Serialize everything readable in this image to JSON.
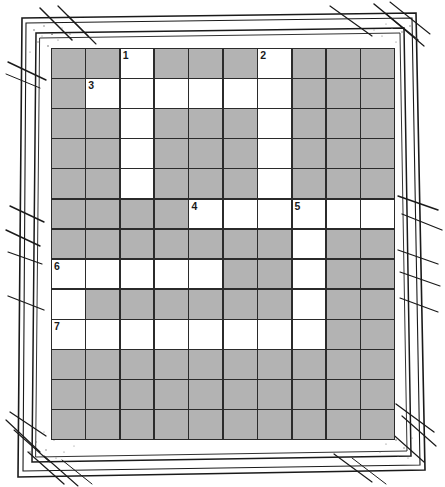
{
  "puzzle": {
    "title": "Crossword Grid",
    "columns": 10,
    "rows": 13,
    "colors": {
      "block": "#b3b3b3",
      "open": "#ffffff",
      "line": "#2b2b2b",
      "number": "#1a1a1a",
      "frame_ink": "#1a1a1a",
      "page": "#ffffff"
    },
    "legend": {
      "open_label": "open cell",
      "block_label": "blocked cell"
    },
    "clue_numbers": [
      {
        "number": "1",
        "row": 0,
        "col": 2
      },
      {
        "number": "2",
        "row": 0,
        "col": 6
      },
      {
        "number": "3",
        "row": 1,
        "col": 1
      },
      {
        "number": "4",
        "row": 5,
        "col": 4
      },
      {
        "number": "5",
        "row": 5,
        "col": 7
      },
      {
        "number": "6",
        "row": 7,
        "col": 0
      },
      {
        "number": "7",
        "row": 9,
        "col": 0
      }
    ],
    "grid": [
      [
        "block",
        "block",
        "open",
        "block",
        "block",
        "block",
        "open",
        "block",
        "block",
        "block"
      ],
      [
        "block",
        "open",
        "open",
        "open",
        "open",
        "open",
        "open",
        "block",
        "block",
        "block"
      ],
      [
        "block",
        "block",
        "open",
        "block",
        "block",
        "block",
        "open",
        "block",
        "block",
        "block"
      ],
      [
        "block",
        "block",
        "open",
        "block",
        "block",
        "block",
        "open",
        "block",
        "block",
        "block"
      ],
      [
        "block",
        "block",
        "open",
        "block",
        "block",
        "block",
        "open",
        "block",
        "block",
        "block"
      ],
      [
        "block",
        "block",
        "block",
        "block",
        "open",
        "open",
        "open",
        "open",
        "open",
        "open"
      ],
      [
        "block",
        "block",
        "block",
        "block",
        "block",
        "block",
        "block",
        "open",
        "block",
        "block"
      ],
      [
        "open",
        "open",
        "open",
        "open",
        "open",
        "block",
        "block",
        "open",
        "block",
        "block"
      ],
      [
        "open",
        "block",
        "block",
        "block",
        "block",
        "block",
        "block",
        "open",
        "block",
        "block"
      ],
      [
        "open",
        "open",
        "open",
        "open",
        "open",
        "open",
        "open",
        "open",
        "block",
        "block"
      ],
      [
        "block",
        "block",
        "block",
        "block",
        "block",
        "block",
        "block",
        "block",
        "block",
        "block"
      ],
      [
        "block",
        "block",
        "block",
        "block",
        "block",
        "block",
        "block",
        "block",
        "block",
        "block"
      ],
      [
        "block",
        "block",
        "block",
        "block",
        "block",
        "block",
        "block",
        "block",
        "block",
        "block"
      ]
    ]
  }
}
